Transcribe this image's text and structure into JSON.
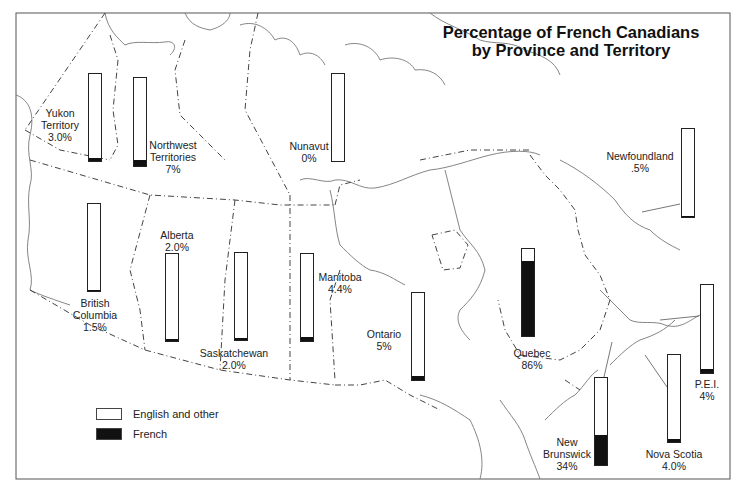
{
  "title": {
    "line1": "Percentage of French Canadians",
    "line2": "by Province and Territory"
  },
  "legend": {
    "items": [
      {
        "label": "English and other",
        "color": "#ffffff"
      },
      {
        "label": "French",
        "color": "#111111"
      }
    ]
  },
  "regions": [
    {
      "name": "Yukon Territory",
      "label_lines": [
        "Yukon",
        "Territory",
        "3.0%"
      ],
      "value_label": "3.0%",
      "french_pct": 3.0,
      "bar": {
        "x": 88,
        "y": 73,
        "h": 87
      },
      "label_pos": {
        "x": 60,
        "y": 107
      }
    },
    {
      "name": "Northwest Territories",
      "label_lines": [
        "Northwest",
        "Territories",
        "7%"
      ],
      "value_label": "7%",
      "french_pct": 7,
      "bar": {
        "x": 133,
        "y": 77,
        "h": 88
      },
      "label_pos": {
        "x": 173,
        "y": 139
      }
    },
    {
      "name": "Nunavut",
      "label_lines": [
        "Nunavut",
        "0%"
      ],
      "value_label": "0%",
      "french_pct": 0,
      "bar": {
        "x": 331,
        "y": 73,
        "h": 87
      },
      "label_pos": {
        "x": 309,
        "y": 140
      }
    },
    {
      "name": "British Columbia",
      "label_lines": [
        "British",
        "Columbia",
        "1.5%"
      ],
      "value_label": "1.5%",
      "french_pct": 1.5,
      "bar": {
        "x": 87,
        "y": 203,
        "h": 87
      },
      "label_pos": {
        "x": 95,
        "y": 297
      }
    },
    {
      "name": "Alberta",
      "label_lines": [
        "Alberta",
        "2.0%"
      ],
      "value_label": "2.0%",
      "french_pct": 2.0,
      "bar": {
        "x": 165,
        "y": 253,
        "h": 87
      },
      "label_pos": {
        "x": 177,
        "y": 229
      }
    },
    {
      "name": "Saskatchewan",
      "label_lines": [
        "Saskatchewan",
        "2.0%"
      ],
      "value_label": "2.0%",
      "french_pct": 2.0,
      "bar": {
        "x": 234,
        "y": 252,
        "h": 87
      },
      "label_pos": {
        "x": 234,
        "y": 347
      }
    },
    {
      "name": "Manitoba",
      "label_lines": [
        "Manitoba",
        "4.4%"
      ],
      "value_label": "4.4%",
      "french_pct": 4.4,
      "bar": {
        "x": 300,
        "y": 253,
        "h": 87
      },
      "label_pos": {
        "x": 340,
        "y": 271
      }
    },
    {
      "name": "Ontario",
      "label_lines": [
        "Ontario",
        "5%"
      ],
      "value_label": "5%",
      "french_pct": 5,
      "bar": {
        "x": 411,
        "y": 292,
        "h": 87
      },
      "label_pos": {
        "x": 384,
        "y": 328
      }
    },
    {
      "name": "Quebec",
      "label_lines": [
        "Quebec",
        "86%"
      ],
      "value_label": "86%",
      "french_pct": 86,
      "bar": {
        "x": 521,
        "y": 248,
        "h": 87
      },
      "label_pos": {
        "x": 532,
        "y": 347
      }
    },
    {
      "name": "Newfoundland",
      "label_lines": [
        "Newfoundland",
        ".5%"
      ],
      "value_label": ".5%",
      "french_pct": 0.5,
      "bar": {
        "x": 681,
        "y": 128,
        "h": 88
      },
      "label_pos": {
        "x": 640,
        "y": 150
      }
    },
    {
      "name": "P.E.I.",
      "label_lines": [
        "P.E.I.",
        "4%"
      ],
      "value_label": "4%",
      "french_pct": 4,
      "bar": {
        "x": 700,
        "y": 284,
        "h": 88
      },
      "label_pos": {
        "x": 707,
        "y": 378
      }
    },
    {
      "name": "New Brunswick",
      "label_lines": [
        "New",
        "Brunswick",
        "34%"
      ],
      "value_label": "34%",
      "french_pct": 34,
      "bar": {
        "x": 594,
        "y": 377,
        "h": 87
      },
      "label_pos": {
        "x": 567,
        "y": 436
      }
    },
    {
      "name": "Nova Scotia",
      "label_lines": [
        "Nova Scotia",
        "4.0%"
      ],
      "value_label": "4.0%",
      "french_pct": 4.0,
      "bar": {
        "x": 667,
        "y": 354,
        "h": 87
      },
      "label_pos": {
        "x": 674,
        "y": 448
      }
    }
  ],
  "chart_data": {
    "type": "bar",
    "subtype": "100% stacked bars placed on map",
    "title": "Percentage of French Canadians by Province and Territory",
    "categories": [
      "Yukon Territory",
      "Northwest Territories",
      "Nunavut",
      "British Columbia",
      "Alberta",
      "Saskatchewan",
      "Manitoba",
      "Ontario",
      "Quebec",
      "Newfoundland",
      "P.E.I.",
      "New Brunswick",
      "Nova Scotia"
    ],
    "series": [
      {
        "name": "French",
        "color": "#111111",
        "values": [
          3.0,
          7,
          0,
          1.5,
          2.0,
          2.0,
          4.4,
          5,
          86,
          0.5,
          4,
          34,
          4.0
        ]
      },
      {
        "name": "English and other",
        "color": "#ffffff",
        "values": [
          97.0,
          93,
          100,
          98.5,
          98.0,
          98.0,
          95.6,
          95,
          14,
          99.5,
          96,
          66,
          96.0
        ]
      }
    ],
    "xlabel": "",
    "ylabel": "",
    "ylim": [
      0,
      100
    ],
    "legend_position": "bottom-left",
    "grid": false,
    "background": "outline map of Canada with provincial/territorial borders (dash-dot)"
  }
}
